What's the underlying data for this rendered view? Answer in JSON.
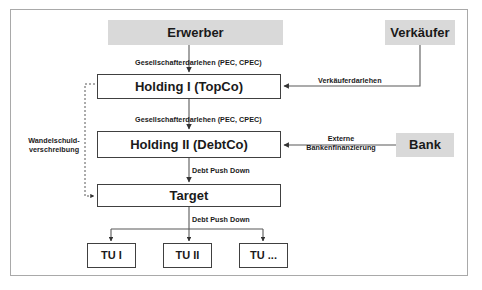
{
  "diagram": {
    "frame_color": "#a9a9a9",
    "shaded_fill": "#d9d9d9",
    "outline_color": "#404040",
    "nodes": {
      "erwerber": "Erwerber",
      "verkaufer": "Verkäufer",
      "holding1": "Holding I (TopCo)",
      "holding2": "Holding II (DebtCo)",
      "bank": "Bank",
      "target": "Target",
      "tu1": "TU I",
      "tu2": "TU II",
      "tu3": "TU ..."
    },
    "edge_labels": {
      "gesellschafterdarlehen_1": "Gesellschafterdarlehen (PEC, CPEC)",
      "gesellschafterdarlehen_2": "Gesellschafterdarlehen (PEC, CPEC)",
      "verkauferdarlehen": "Verkäuferdarlehen",
      "externe_bankenfinanzierung_line1": "Externe",
      "externe_bankenfinanzierung_line2": "Bankenfinanzierung",
      "debt_push_down_1": "Debt Push Down",
      "debt_push_down_2": "Debt Push Down",
      "wandelschuld_line1": "Wandelschuld-",
      "wandelschuld_line2": "verschreibung"
    }
  }
}
